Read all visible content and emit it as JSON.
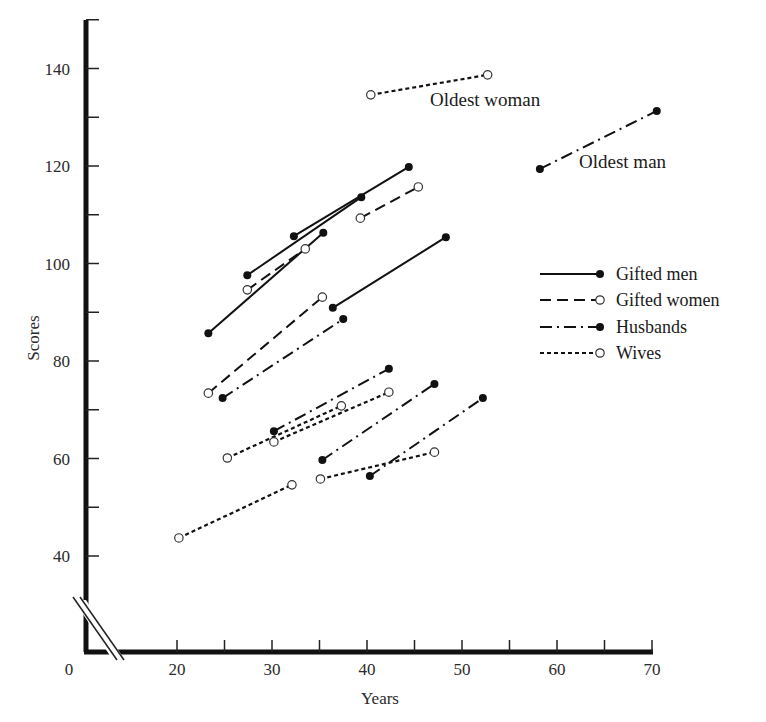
{
  "chart_data": {
    "type": "line",
    "title": "",
    "xlabel": "Years",
    "ylabel": "Scores",
    "xlim": [
      0,
      70
    ],
    "ylim": [
      0,
      150
    ],
    "axis_break": true,
    "x_ticks": [
      20,
      25,
      30,
      35,
      40,
      45,
      50,
      55,
      60,
      65,
      70
    ],
    "x_tick_labels": [
      "0",
      "20",
      "30",
      "40",
      "50",
      "60",
      "70"
    ],
    "y_ticks": [
      40,
      50,
      60,
      70,
      80,
      90,
      100,
      110,
      120,
      130,
      140,
      150
    ],
    "y_tick_labels": [
      "40",
      "60",
      "80",
      "100",
      "120",
      "140"
    ],
    "grid": false,
    "legend_position": "right-middle",
    "legend": [
      {
        "name": "Gifted men",
        "line": "solid",
        "marker": "filled"
      },
      {
        "name": "Gifted women",
        "line": "dashed",
        "marker": "open"
      },
      {
        "name": "Husbands",
        "line": "dashdot",
        "marker": "filled"
      },
      {
        "name": "Wives",
        "line": "dotted",
        "marker": "open"
      }
    ],
    "series": [
      {
        "name": "Gifted men",
        "segments": [
          [
            [
              23.3,
              85.7
            ],
            [
              35.4,
              106.3
            ]
          ],
          [
            [
              27.4,
              97.6
            ],
            [
              39.4,
              113.6
            ]
          ],
          [
            [
              32.3,
              105.6
            ],
            [
              44.4,
              119.8
            ]
          ],
          [
            [
              36.4,
              90.9
            ],
            [
              48.3,
              105.4
            ]
          ]
        ]
      },
      {
        "name": "Gifted women",
        "segments": [
          [
            [
              27.4,
              94.6
            ],
            [
              33.5,
              103.0
            ]
          ],
          [
            [
              39.3,
              109.3
            ],
            [
              45.4,
              115.7
            ]
          ],
          [
            [
              23.3,
              73.4
            ],
            [
              35.3,
              93.1
            ]
          ]
        ]
      },
      {
        "name": "Husbands",
        "segments": [
          [
            [
              58.2,
              119.4
            ],
            [
              70.5,
              131.3
            ]
          ],
          [
            [
              24.8,
              72.4
            ],
            [
              37.5,
              88.6
            ]
          ],
          [
            [
              30.2,
              65.6
            ],
            [
              42.3,
              78.4
            ]
          ],
          [
            [
              35.3,
              59.7
            ],
            [
              47.1,
              75.3
            ]
          ],
          [
            [
              40.3,
              56.4
            ],
            [
              52.2,
              72.4
            ]
          ]
        ]
      },
      {
        "name": "Wives",
        "segments": [
          [
            [
              40.4,
              134.6
            ],
            [
              52.7,
              138.7
            ]
          ],
          [
            [
              25.3,
              60.1
            ],
            [
              37.3,
              70.8
            ]
          ],
          [
            [
              30.2,
              63.4
            ],
            [
              42.3,
              73.6
            ]
          ],
          [
            [
              35.1,
              55.8
            ],
            [
              47.1,
              61.3
            ]
          ],
          [
            [
              20.2,
              43.7
            ],
            [
              32.1,
              54.6
            ]
          ]
        ]
      }
    ],
    "annotations": [
      {
        "text": "Oldest woman",
        "x": 46,
        "y": 132
      },
      {
        "text": "Oldest man",
        "x": 62,
        "y": 118
      }
    ]
  },
  "labels": {
    "xlabel": "Years",
    "ylabel": "Scores",
    "oldest_woman": "Oldest woman",
    "oldest_man": "Oldest man",
    "origin": "0",
    "legend": [
      "Gifted men",
      "Gifted women",
      "Husbands",
      "Wives"
    ]
  }
}
